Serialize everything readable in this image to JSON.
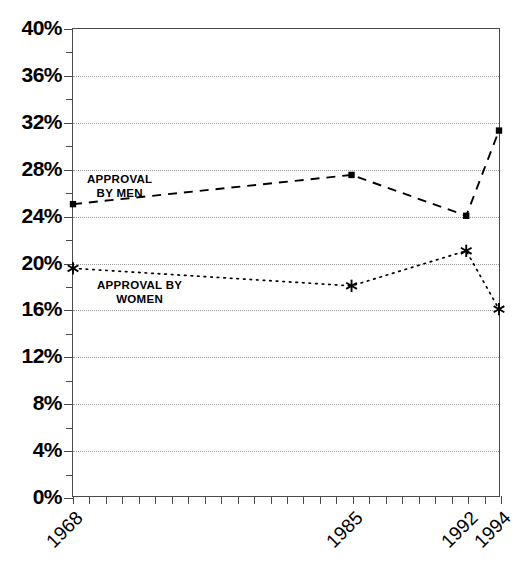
{
  "chart_data": {
    "type": "line",
    "title": "",
    "subtitle": "",
    "xlabel": "",
    "ylabel": "",
    "xlim": [
      1968,
      1994
    ],
    "ylim": [
      0,
      40
    ],
    "grid": true,
    "legend_position": "inline-annotations",
    "x": [
      1968,
      1985,
      1992,
      1994
    ],
    "categories": [
      "1968",
      "1985",
      "1992",
      "1994"
    ],
    "xtick_labels": [
      "1968",
      "1985",
      "1992",
      "1994"
    ],
    "xtick_values": [
      1968,
      1985,
      1992,
      1994
    ],
    "xtick_minor_values": [
      1968,
      1969,
      1970,
      1971,
      1972,
      1973,
      1974,
      1975,
      1976,
      1977,
      1978,
      1979,
      1980,
      1981,
      1982,
      1983,
      1984,
      1985,
      1986,
      1987,
      1988,
      1989,
      1990,
      1991,
      1992,
      1993,
      1994
    ],
    "ytick_labels": [
      "0%",
      "4%",
      "8%",
      "12%",
      "16%",
      "20%",
      "24%",
      "28%",
      "32%",
      "36%",
      "40%"
    ],
    "ytick_values": [
      0,
      4,
      8,
      12,
      16,
      20,
      24,
      28,
      32,
      36,
      40
    ],
    "ytick_minor_values": [
      2,
      6,
      10,
      14,
      18,
      22,
      26,
      30,
      34,
      38
    ],
    "series": [
      {
        "name": "APPROVAL BY MEN",
        "annotation_lines": [
          "APPROVAL",
          "BY MEN"
        ],
        "values": [
          25.0,
          27.5,
          24.0,
          31.3
        ],
        "line_style": "dashed",
        "marker": "square",
        "color": "#000000"
      },
      {
        "name": "APPROVAL BY WOMEN",
        "annotation_lines": [
          "APPROVAL BY",
          "WOMEN"
        ],
        "values": [
          19.5,
          18.0,
          21.0,
          16.0
        ],
        "line_style": "dotted",
        "marker": "asterisk",
        "color": "#000000"
      }
    ]
  },
  "axes": {
    "frame_color": "#4a4a4a",
    "gridline_color": "#9a9a9a",
    "background": "#ffffff"
  }
}
